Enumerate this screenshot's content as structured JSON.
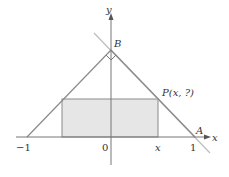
{
  "diagram": {
    "axes": {
      "x_label": "x",
      "y_label": "y",
      "origin_label": "0",
      "tick_left": "−1",
      "tick_right": "1",
      "tick_x": "x"
    },
    "points": {
      "A": "A",
      "B": "B",
      "P": "P(x, ?)"
    },
    "colors": {
      "line": "#8a8a8a",
      "rect_fill": "#e6e6e6",
      "extended_line": "#bdbdbd"
    }
  }
}
